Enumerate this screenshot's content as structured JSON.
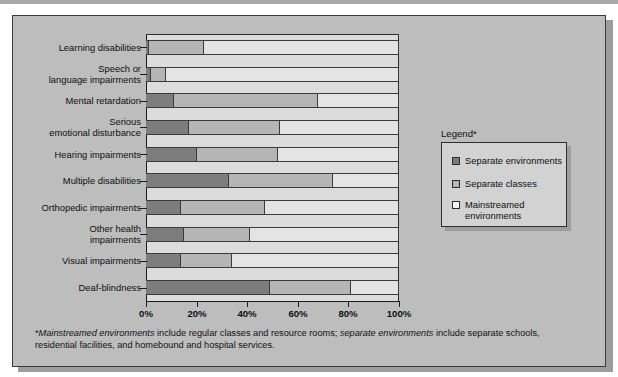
{
  "figure": {
    "legend_title": "Legend*",
    "footnote_parts": {
      "asterisk": "*",
      "italic1": "Mainstreamed environments",
      "text1": " include regular classes and resource rooms; ",
      "italic2": "separate environments",
      "text2": " include separate schools, residential facilities, and homebound and hospital services."
    }
  },
  "colors": {
    "panel_background": "#bdbdbd",
    "plot_background": "#dcdcdc",
    "separate_environments": "#7d7d7d",
    "separate_classes": "#b5b5b5",
    "mainstreamed_environments": "#e4e4e4",
    "axis": "#1d1d1d",
    "legend_background": "#d2d2d2"
  },
  "legend": {
    "items": [
      {
        "label": "Separate environments",
        "swatch": "#7d7d7d"
      },
      {
        "label": "Separate classes",
        "swatch": "#b5b5b5"
      },
      {
        "label": "Mainstreamed\nenvironments",
        "swatch": "#f2f2f2"
      }
    ]
  },
  "chart_data": {
    "type": "bar",
    "orientation": "horizontal",
    "stacked": true,
    "stack_total": 100,
    "title": "",
    "subtitle": "",
    "xlabel": "",
    "ylabel": "",
    "xlim": [
      0,
      100
    ],
    "xticks": [
      0,
      20,
      40,
      60,
      80,
      100
    ],
    "xtick_labels": [
      "0%",
      "20%",
      "40%",
      "60%",
      "80%",
      "100%"
    ],
    "grid": false,
    "legend_position": "right",
    "categories": [
      "Learning disabilities",
      "Speech or\nlanguage impairments",
      "Mental retardation",
      "Serious\nemotional disturbance",
      "Hearing impairments",
      "Multiple disabilities",
      "Orthopedic impairments",
      "Other health\nimpairments",
      "Visual impairments",
      "Deaf-blindness"
    ],
    "series": [
      {
        "name": "Separate environments",
        "color": "#7d7d7d",
        "values": [
          1,
          2,
          11,
          17,
          20,
          33,
          14,
          15,
          14,
          49
        ]
      },
      {
        "name": "Separate classes",
        "color": "#b5b5b5",
        "values": [
          22,
          6,
          57,
          36,
          32,
          41,
          33,
          26,
          20,
          32
        ]
      },
      {
        "name": "Mainstreamed environments",
        "color": "#e4e4e4",
        "values": [
          77,
          92,
          32,
          47,
          48,
          26,
          53,
          59,
          66,
          19
        ]
      }
    ]
  }
}
